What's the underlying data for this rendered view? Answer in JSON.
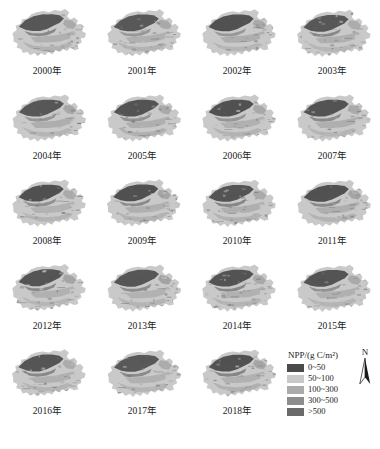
{
  "figure": {
    "kind": "npp-map-series",
    "unit_label": "NPP/(g C/m",
    "unit_sup": "2",
    "unit_close": ")"
  },
  "panels": [
    {
      "year_label": "2000年",
      "year": 2000
    },
    {
      "year_label": "2001年",
      "year": 2001
    },
    {
      "year_label": "2002年",
      "year": 2002
    },
    {
      "year_label": "2003年",
      "year": 2003
    },
    {
      "year_label": "2004年",
      "year": 2004
    },
    {
      "year_label": "2005年",
      "year": 2005
    },
    {
      "year_label": "2006年",
      "year": 2006
    },
    {
      "year_label": "2007年",
      "year": 2007
    },
    {
      "year_label": "2008年",
      "year": 2008
    },
    {
      "year_label": "2009年",
      "year": 2009
    },
    {
      "year_label": "2010年",
      "year": 2010
    },
    {
      "year_label": "2011年",
      "year": 2011
    },
    {
      "year_label": "2012年",
      "year": 2012
    },
    {
      "year_label": "2013年",
      "year": 2013
    },
    {
      "year_label": "2014年",
      "year": 2014
    },
    {
      "year_label": "2015年",
      "year": 2015
    },
    {
      "year_label": "2016年",
      "year": 2016
    },
    {
      "year_label": "2017年",
      "year": 2017
    },
    {
      "year_label": "2018年",
      "year": 2018
    }
  ],
  "legend": {
    "title_text": "NPP/(g C/m²)",
    "classes": [
      {
        "label": "0~50",
        "color": "#4a4a4a"
      },
      {
        "label": "50~100",
        "color": "#c9c9c9"
      },
      {
        "label": "100~300",
        "color": "#ababab"
      },
      {
        "label": "300~500",
        "color": "#8d8d8d"
      },
      {
        "label": ">500",
        "color": "#6a6a6a"
      }
    ]
  },
  "north_arrow": {
    "label": "N"
  },
  "chart_data": {
    "type": "heatmap",
    "title": "NPP/(g C/m²)",
    "xlabel": "",
    "ylabel": "",
    "legend_position": "bottom-right",
    "grid": false,
    "panel_layout": {
      "rows": 5,
      "cols": 4,
      "panels": 19
    },
    "categories": [
      "2000年",
      "2001年",
      "2002年",
      "2003年",
      "2004年",
      "2005年",
      "2006年",
      "2007年",
      "2008年",
      "2009年",
      "2010年",
      "2011年",
      "2012年",
      "2013年",
      "2014年",
      "2015年",
      "2016年",
      "2017年",
      "2018年"
    ],
    "class_breaks": [
      0,
      50,
      100,
      300,
      500
    ],
    "class_labels": [
      "0~50",
      "50~100",
      "100~300",
      "300~500",
      ">500"
    ],
    "class_colors": [
      "#4a4a4a",
      "#c9c9c9",
      "#ababab",
      "#8d8d8d",
      "#6a6a6a"
    ],
    "units": "g C/m²",
    "annotations": [
      "N"
    ]
  }
}
